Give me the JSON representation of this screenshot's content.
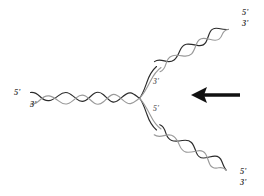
{
  "figure": {
    "background_color": "#ffffff",
    "width": 264,
    "height": 196
  },
  "colors": {
    "leading_strand": "#2b2b2b",
    "lagging_strand": "#8f8f8f",
    "label_dark": "#3a3a3a",
    "label_gray": "#6e6e6e",
    "arrow": "#111111"
  },
  "labels": {
    "parent_five_prime": "5'",
    "parent_three_prime": "3'",
    "fork_upper_three_prime": "3'",
    "fork_lower_five_prime": "5'",
    "upper_end_five_prime": "5'",
    "upper_end_three_prime": "3'",
    "lower_end_five_prime": "5'",
    "lower_end_three_prime": "3'"
  },
  "duplexes": [
    {
      "name": "parent-duplex",
      "orientation": "horizontal",
      "start": [
        30,
        98
      ],
      "end": [
        140,
        98
      ],
      "crossings": 8,
      "five_prime_label": "5'",
      "three_prime_label": "3'"
    },
    {
      "name": "upper-daughter-duplex",
      "orientation": "diagonal-up-right",
      "start": [
        158,
        66
      ],
      "end": [
        238,
        22
      ],
      "crossings": 6,
      "five_prime_label": "5'",
      "three_prime_label": "3'"
    },
    {
      "name": "lower-daughter-duplex",
      "orientation": "diagonal-down-right",
      "start": [
        158,
        130
      ],
      "end": [
        236,
        174
      ],
      "crossings": 6,
      "five_prime_label": "5'",
      "three_prime_label": "3'"
    }
  ],
  "arrow": {
    "name": "fork-direction-arrow",
    "direction": "left",
    "tail_x": 240,
    "tip_x": 192,
    "y": 95
  }
}
